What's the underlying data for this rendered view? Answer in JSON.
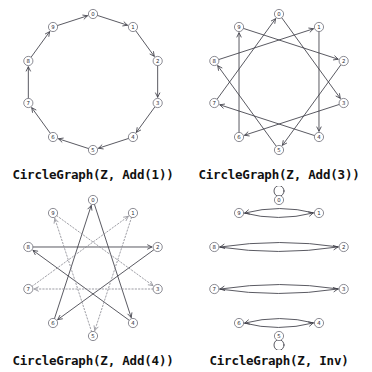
{
  "figure": {
    "background_color": "#ffffff",
    "edge_color": "#3c3c46",
    "dotted_edge_color": "#8d8d95",
    "node_fill": "#ffffff",
    "node_stroke": "#6e6e78",
    "node_count": 10,
    "node_labels": [
      "0",
      "1",
      "2",
      "3",
      "4",
      "5",
      "6",
      "7",
      "8",
      "9"
    ]
  },
  "panels": [
    {
      "id": "add1",
      "caption": "CircleGraph(Z, Add(1))",
      "layout": "circle",
      "description": "directed 10-cycle, each node i points to i+1 mod 10",
      "edges": [
        {
          "from": 0,
          "to": 1,
          "style": "solid"
        },
        {
          "from": 1,
          "to": 2,
          "style": "solid"
        },
        {
          "from": 2,
          "to": 3,
          "style": "solid"
        },
        {
          "from": 3,
          "to": 4,
          "style": "solid"
        },
        {
          "from": 4,
          "to": 5,
          "style": "solid"
        },
        {
          "from": 5,
          "to": 6,
          "style": "solid"
        },
        {
          "from": 6,
          "to": 7,
          "style": "solid"
        },
        {
          "from": 7,
          "to": 8,
          "style": "solid"
        },
        {
          "from": 8,
          "to": 9,
          "style": "solid"
        },
        {
          "from": 9,
          "to": 0,
          "style": "solid"
        }
      ],
      "self_loops": []
    },
    {
      "id": "add3",
      "caption": "CircleGraph(Z, Add(3))",
      "layout": "circle",
      "description": "star polygon {10/3}, each node i points to i+3 mod 10",
      "edges": [
        {
          "from": 0,
          "to": 3,
          "style": "solid"
        },
        {
          "from": 1,
          "to": 4,
          "style": "solid"
        },
        {
          "from": 2,
          "to": 5,
          "style": "solid"
        },
        {
          "from": 3,
          "to": 6,
          "style": "solid"
        },
        {
          "from": 4,
          "to": 7,
          "style": "solid"
        },
        {
          "from": 5,
          "to": 8,
          "style": "solid"
        },
        {
          "from": 6,
          "to": 9,
          "style": "solid"
        },
        {
          "from": 7,
          "to": 0,
          "style": "solid"
        },
        {
          "from": 8,
          "to": 1,
          "style": "solid"
        },
        {
          "from": 9,
          "to": 2,
          "style": "solid"
        }
      ],
      "self_loops": []
    },
    {
      "id": "add4",
      "caption": "CircleGraph(Z, Add(4))",
      "layout": "circle",
      "description": "two 5-cycles, each node i points to i+4 mod 10; even component solid, odd component dotted",
      "edges": [
        {
          "from": 0,
          "to": 4,
          "style": "solid"
        },
        {
          "from": 4,
          "to": 8,
          "style": "solid"
        },
        {
          "from": 8,
          "to": 2,
          "style": "solid"
        },
        {
          "from": 2,
          "to": 6,
          "style": "solid"
        },
        {
          "from": 6,
          "to": 0,
          "style": "solid"
        },
        {
          "from": 1,
          "to": 5,
          "style": "dotted"
        },
        {
          "from": 5,
          "to": 9,
          "style": "dotted"
        },
        {
          "from": 9,
          "to": 3,
          "style": "dotted"
        },
        {
          "from": 3,
          "to": 7,
          "style": "dotted"
        },
        {
          "from": 7,
          "to": 1,
          "style": "dotted"
        }
      ],
      "self_loops": []
    },
    {
      "id": "inv",
      "caption": "CircleGraph(Z, Inv)",
      "layout": "circle",
      "description": "involution: i paired with -i mod 10, drawn as two opposed arcs; nodes 0 and 5 carry self-loops",
      "edges": [
        {
          "from": 1,
          "to": 9,
          "style": "solid"
        },
        {
          "from": 9,
          "to": 1,
          "style": "solid"
        },
        {
          "from": 2,
          "to": 8,
          "style": "solid"
        },
        {
          "from": 8,
          "to": 2,
          "style": "solid"
        },
        {
          "from": 3,
          "to": 7,
          "style": "solid"
        },
        {
          "from": 7,
          "to": 3,
          "style": "solid"
        },
        {
          "from": 4,
          "to": 6,
          "style": "solid"
        },
        {
          "from": 6,
          "to": 4,
          "style": "solid"
        }
      ],
      "self_loops": [
        {
          "at": 0,
          "side": "up"
        },
        {
          "at": 5,
          "side": "down"
        }
      ]
    }
  ]
}
